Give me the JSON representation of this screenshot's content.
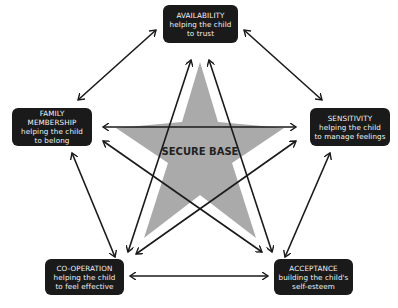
{
  "diagram": {
    "center": {
      "label": "SECURE BASE",
      "color": "#aaaaaa"
    },
    "nodes": [
      {
        "id": "availability",
        "title": "AVAILABILITY",
        "line1": "helping the child",
        "line2": "to trust"
      },
      {
        "id": "sensitivity",
        "title": "SENSITIVITY",
        "line1": "helping the child",
        "line2": "to manage feelings"
      },
      {
        "id": "acceptance",
        "title": "ACCEPTANCE",
        "line1": "building the child's",
        "line2": "self-esteem"
      },
      {
        "id": "co-operation",
        "title": "CO-OPERATION",
        "line1": "helping the child",
        "line2": "to feel effective"
      },
      {
        "id": "family-membership",
        "title": "FAMILY MEMBERSHIP",
        "line1": "helping the child",
        "line2": "to belong"
      }
    ],
    "connections": "every node connects to every other node with a double-headed arrow",
    "colors": {
      "node_bg": "#1a1a1a",
      "node_text": "#f2f2f2",
      "arrow": "#1a1a1a",
      "star": "#aaaaaa"
    }
  }
}
